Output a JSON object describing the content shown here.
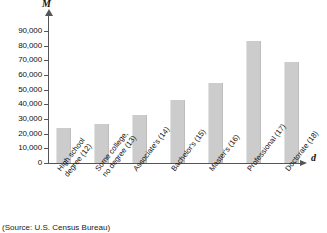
{
  "chart_data": {
    "type": "bar",
    "title": "",
    "xlabel": "d",
    "ylabel": "M",
    "ylim": [
      0,
      90000
    ],
    "grid": false,
    "legend": "none",
    "categories": [
      "High school degree (12)",
      "Some college, no degree (13)",
      "Associate's (14)",
      "Bachelor's (15)",
      "Master's (16)",
      "Professional (17)",
      "Doctorate (18)"
    ],
    "category_lines": [
      [
        "High school",
        "degree (12)"
      ],
      [
        "Some college,",
        "no degree (13)"
      ],
      [
        "Associate's (14)"
      ],
      [
        "Bachelor's (15)"
      ],
      [
        "Master's (16)"
      ],
      [
        "Professional (17)"
      ],
      [
        "Doctorate (18)"
      ]
    ],
    "values": [
      24000,
      26500,
      33000,
      43000,
      54500,
      83000,
      69000
    ],
    "ytick_values": [
      0,
      10000,
      20000,
      30000,
      40000,
      50000,
      60000,
      70000,
      80000,
      90000
    ],
    "ytick_labels": [
      "0",
      "10,000",
      "20,000",
      "30,000",
      "40,000",
      "50,000",
      "60,000",
      "70,000",
      "80,000",
      "90,000"
    ],
    "bar_color": "#cccccc",
    "axis_color": "#555555"
  },
  "caption": {
    "source": "(Source: U.S. Census Bureau)"
  }
}
